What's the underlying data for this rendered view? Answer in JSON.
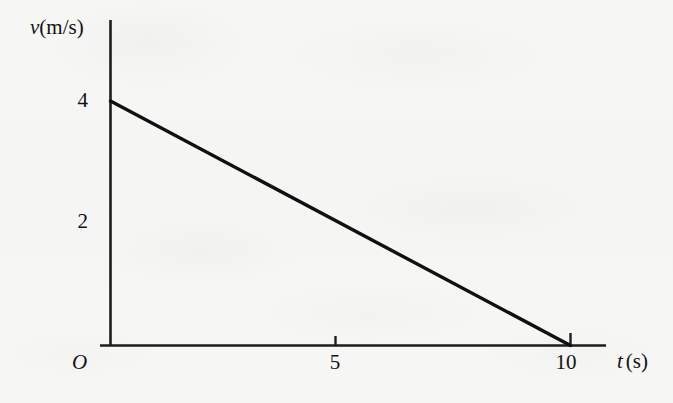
{
  "chart_data": {
    "type": "line",
    "title": "",
    "xlabel": "t (s)",
    "ylabel": "v(m/s)",
    "origin_label": "O",
    "x": [
      0,
      10
    ],
    "y": [
      4,
      0
    ],
    "series": [
      {
        "name": "velocity",
        "x": [
          0,
          10
        ],
        "values": [
          4,
          0
        ]
      }
    ],
    "xlim": [
      0,
      11
    ],
    "ylim": [
      0,
      4.6
    ],
    "xticks": [
      5,
      10
    ],
    "xticklabels": [
      "5",
      "10"
    ],
    "yticks": [
      2,
      4
    ],
    "yticklabels": [
      "2",
      "4"
    ],
    "grid": false,
    "legend": false,
    "line_color": "#101010",
    "axis_color": "#1a1a1a",
    "background_color": "#f6f6f5"
  },
  "axes": {
    "y_label_var": "v",
    "y_label_unit": "(m/s)",
    "x_label_var": "t",
    "x_label_unit": "(s)",
    "origin": "O"
  },
  "ticks": {
    "y": [
      {
        "label": "4",
        "value": 4
      },
      {
        "label": "2",
        "value": 2
      }
    ],
    "x": [
      {
        "label": "5",
        "value": 5
      },
      {
        "label": "10",
        "value": 10
      }
    ]
  }
}
